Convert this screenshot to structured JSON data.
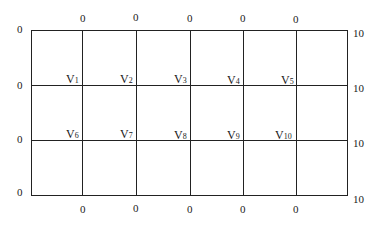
{
  "diagram": {
    "type": "finite-difference grid",
    "top_boundary": [
      "0",
      "0",
      "0",
      "0",
      "0"
    ],
    "bottom_boundary": [
      "0",
      "0",
      "0",
      "0",
      "0"
    ],
    "left_boundary": [
      "0",
      "0",
      "0",
      "0"
    ],
    "right_boundary": [
      "10",
      "10",
      "10",
      "10"
    ],
    "nodes": [
      {
        "base": "V",
        "sub": "1"
      },
      {
        "base": "V",
        "sub": "2"
      },
      {
        "base": "V",
        "sub": "3"
      },
      {
        "base": "V",
        "sub": "4"
      },
      {
        "base": "V",
        "sub": "5"
      },
      {
        "base": "V",
        "sub": "6"
      },
      {
        "base": "V",
        "sub": "7"
      },
      {
        "base": "V",
        "sub": "8"
      },
      {
        "base": "V",
        "sub": "9"
      },
      {
        "base": "V",
        "sub": "10"
      }
    ]
  }
}
